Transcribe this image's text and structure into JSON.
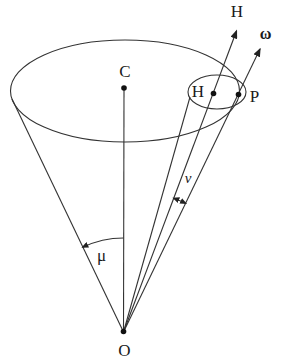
{
  "figure": {
    "type": "cone-precession-diagram",
    "colors": {
      "background": "#ffffff",
      "line": "#333333",
      "text": "#1a1a1a"
    },
    "labels": {
      "h_vector": "H",
      "omega_vector": "ω",
      "center_c": "C",
      "h_point": "H",
      "p_point": "P",
      "origin_o": "O",
      "mu_angle": "μ",
      "nu_angle": "ν"
    }
  }
}
